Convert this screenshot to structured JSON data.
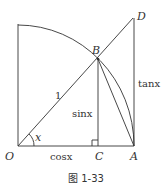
{
  "diagram": {
    "points": {
      "O": "O",
      "A": "A",
      "B": "B",
      "C": "C",
      "D": "D"
    },
    "labels": {
      "radius": "1",
      "angle": "x",
      "sin": "sinx",
      "cos": "cosx",
      "tan": "tanx"
    },
    "caption": "图 1-33",
    "stroke_color": "#333333"
  }
}
